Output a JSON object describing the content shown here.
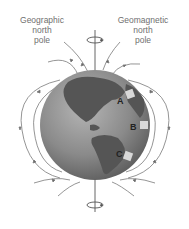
{
  "labels": {
    "geographic_pole": [
      "Geographic",
      "north",
      "pole"
    ],
    "geomagnetic_pole": [
      "Geomagnetic",
      "north",
      "pole"
    ]
  },
  "markers": [
    {
      "id": "A",
      "label": "A"
    },
    {
      "id": "B",
      "label": "B"
    },
    {
      "id": "C",
      "label": "C"
    }
  ],
  "colors": {
    "field_lines": "#7a7a7a",
    "ocean": "#8c8c8c",
    "land": "#555555",
    "text": "#6f6f6f"
  }
}
